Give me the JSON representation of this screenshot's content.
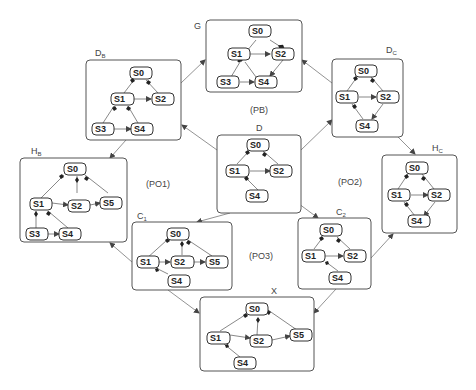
{
  "labels": {
    "G": "G",
    "DB": "D",
    "DB_sub": "B",
    "DC": "D",
    "DC_sub": "C",
    "D": "D",
    "HB": "H",
    "HB_sub": "B",
    "HC": "H",
    "HC_sub": "C",
    "C1": "C",
    "C1_sub": "1",
    "C2": "C",
    "C2_sub": "2",
    "X": "X",
    "PB": "(PB)",
    "PO1": "(PO1)",
    "PO2": "(PO2)",
    "PO3": "(PO3)"
  },
  "states": {
    "S0": "S0",
    "S1": "S1",
    "S2": "S2",
    "S3": "S3",
    "S4": "S4",
    "S5": "S5"
  },
  "graphs": [
    {
      "id": "G",
      "states": [
        "S0",
        "S1",
        "S2",
        "S3",
        "S4"
      ]
    },
    {
      "id": "D_B",
      "states": [
        "S0",
        "S1",
        "S2",
        "S3",
        "S4"
      ]
    },
    {
      "id": "D_C",
      "states": [
        "S0",
        "S1",
        "S2",
        "S4"
      ]
    },
    {
      "id": "D",
      "states": [
        "S0",
        "S1",
        "S2",
        "S4"
      ]
    },
    {
      "id": "H_B",
      "states": [
        "S0",
        "S1",
        "S2",
        "S3",
        "S4",
        "S5"
      ]
    },
    {
      "id": "H_C",
      "states": [
        "S0",
        "S1",
        "S2",
        "S4"
      ]
    },
    {
      "id": "C_1",
      "states": [
        "S0",
        "S1",
        "S2",
        "S4",
        "S5"
      ]
    },
    {
      "id": "C_2",
      "states": [
        "S0",
        "S1",
        "S2",
        "S4"
      ]
    },
    {
      "id": "X",
      "states": [
        "S0",
        "S1",
        "S2",
        "S4",
        "S5"
      ]
    }
  ],
  "connections": [
    [
      "D",
      "D_B"
    ],
    [
      "D",
      "D_C"
    ],
    [
      "D",
      "C_1"
    ],
    [
      "D",
      "C_2"
    ],
    [
      "D_B",
      "G"
    ],
    [
      "D_C",
      "G"
    ],
    [
      "D_B",
      "H_B"
    ],
    [
      "D_C",
      "H_C"
    ],
    [
      "C_1",
      "H_B"
    ],
    [
      "C_2",
      "H_C"
    ],
    [
      "C_1",
      "X"
    ],
    [
      "C_2",
      "X"
    ]
  ]
}
